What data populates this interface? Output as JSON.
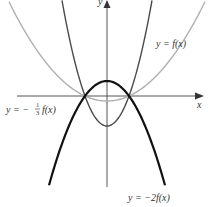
{
  "diagram": {
    "title": "",
    "axes": {
      "x_label": "x",
      "y_label": "y"
    },
    "curves": [
      {
        "id": "f",
        "label_prefix": "y = ",
        "label_func": "f(x)",
        "label": "y = f(x)",
        "color": "#111111",
        "stroke_width": 2.2,
        "scale": 1
      },
      {
        "id": "neg2f",
        "label": "y = −2f(x)",
        "label_prefix": "y = −2",
        "label_func": "f(x)",
        "color": "#4a4a4a",
        "stroke_width": 1.4,
        "scale": -2
      },
      {
        "id": "neg_third_f",
        "label": "y = −⅓ f(x)",
        "label_prefix": "y = −",
        "label_frac_num": "1",
        "label_frac_den": "3",
        "label_func": "f(x)",
        "color": "#b0b0b0",
        "stroke_width": 1.4,
        "scale": -0.3333
      }
    ],
    "colors": {
      "axis": "#444444",
      "background": "#ffffff"
    }
  },
  "chart_data": {
    "type": "line",
    "xlabel": "x",
    "ylabel": "y",
    "grid": false,
    "legend_position": "inline-labels",
    "series": [
      {
        "name": "y = f(x)",
        "description": "upward parabola, roots at ±r, vertex below x-axis"
      },
      {
        "name": "y = −2f(x)",
        "description": "downward parabola, same roots, vertex 2× height above axis"
      },
      {
        "name": "y = −(1/3)f(x)",
        "description": "downward parabola, same roots, vertex 1/3 height above axis"
      }
    ],
    "annotations": [
      "y = f(x)",
      "y = −(1/3) f(x)",
      "y = −2f(x)"
    ]
  }
}
